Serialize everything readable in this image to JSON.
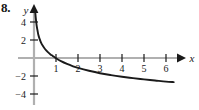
{
  "figure": {
    "problem_number": "8.",
    "axis_labels": {
      "x": "x",
      "y": "y"
    }
  },
  "chart_data": {
    "type": "line",
    "title": "",
    "subtitle": "",
    "xlabel": "x",
    "ylabel": "y",
    "xlim": [
      -0.5,
      6.6
    ],
    "ylim": [
      -4.6,
      5.2
    ],
    "grid": false,
    "legend": null,
    "x_ticks": [
      1,
      2,
      3,
      4,
      5,
      6
    ],
    "x_tick_labels": [
      "1",
      "2",
      "3",
      "4",
      "5",
      "6"
    ],
    "y_ticks": [
      -4,
      -2,
      2,
      4
    ],
    "y_tick_labels": [
      "-4",
      "-2",
      "2",
      "4"
    ],
    "series": [
      {
        "name": "curve",
        "color": "#1a1a1a",
        "note": "decreasing logarithmic curve, vertical asymptote at x = 0, zero crossing near x = 0.85",
        "x": [
          0.06,
          0.08,
          0.1,
          0.13,
          0.16,
          0.2,
          0.25,
          0.32,
          0.4,
          0.5,
          0.62,
          0.75,
          0.85,
          1.0,
          1.25,
          1.5,
          1.75,
          2.0,
          2.5,
          3.0,
          3.5,
          4.0,
          4.5,
          5.0,
          5.5,
          6.0,
          6.35
        ],
        "y": [
          5.0,
          4.45,
          4.0,
          3.45,
          3.05,
          2.55,
          2.15,
          1.7,
          1.35,
          1.0,
          0.68,
          0.4,
          0.23,
          -0.03,
          -0.38,
          -0.66,
          -0.9,
          -1.1,
          -1.42,
          -1.69,
          -1.9,
          -2.08,
          -2.24,
          -2.38,
          -2.5,
          -2.62,
          -2.68
        ]
      }
    ]
  }
}
